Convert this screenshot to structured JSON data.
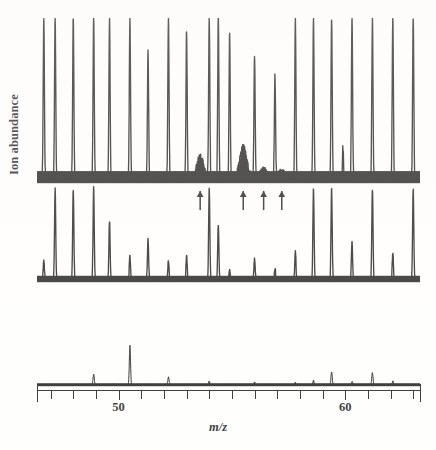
{
  "figure": {
    "type": "mass-spectrum",
    "ylabel": "Ion abundance",
    "xlabel": "m/z"
  },
  "axis": {
    "tick_labels": [
      {
        "value": 50,
        "text": "50"
      },
      {
        "value": 60,
        "text": "60"
      }
    ],
    "xlim": [
      46.4,
      63.3
    ],
    "tick_step": 1,
    "labelled_ticks": [
      50,
      60
    ]
  },
  "annotations": {
    "arrow_glyph": "arrow-up",
    "arrow_positions_mz": [
      53.6,
      55.5,
      56.4,
      57.2
    ]
  },
  "chart_data": {
    "type": "line",
    "title": "",
    "subtitle": "",
    "xlabel": "m/z",
    "ylabel": "Ion abundance",
    "xlim": [
      46.4,
      63.3
    ],
    "grid": false,
    "legend": null,
    "panels": [
      {
        "name": "top-trace",
        "baseline_noise": 0.035,
        "clipped": true,
        "peaks": [
          {
            "mz": 46.7,
            "height": 1.0,
            "clipped": true
          },
          {
            "mz": 47.2,
            "height": 1.0,
            "clipped": true
          },
          {
            "mz": 48.0,
            "height": 1.0,
            "clipped": true
          },
          {
            "mz": 48.9,
            "height": 1.0,
            "clipped": true
          },
          {
            "mz": 49.6,
            "height": 1.0,
            "clipped": true
          },
          {
            "mz": 50.5,
            "height": 1.0,
            "clipped": true
          },
          {
            "mz": 51.3,
            "height": 0.78,
            "clipped": false
          },
          {
            "mz": 52.2,
            "height": 1.0,
            "clipped": true
          },
          {
            "mz": 53.0,
            "height": 0.93,
            "clipped": false
          },
          {
            "mz": 53.6,
            "height": 0.14,
            "clipped": false,
            "broad": true
          },
          {
            "mz": 54.0,
            "height": 1.0,
            "clipped": true
          },
          {
            "mz": 54.4,
            "height": 1.0,
            "clipped": true
          },
          {
            "mz": 54.9,
            "height": 0.9,
            "clipped": false
          },
          {
            "mz": 55.5,
            "height": 0.2,
            "clipped": false,
            "broad": true
          },
          {
            "mz": 56.0,
            "height": 0.76,
            "clipped": false
          },
          {
            "mz": 56.4,
            "height": 0.06,
            "clipped": false,
            "broad": true
          },
          {
            "mz": 56.9,
            "height": 0.64,
            "clipped": false
          },
          {
            "mz": 57.2,
            "height": 0.05,
            "clipped": false,
            "broad": true
          },
          {
            "mz": 57.8,
            "height": 1.0,
            "clipped": true
          },
          {
            "mz": 58.6,
            "height": 1.0,
            "clipped": true
          },
          {
            "mz": 59.4,
            "height": 1.0,
            "clipped": true
          },
          {
            "mz": 59.9,
            "height": 0.2,
            "clipped": false
          },
          {
            "mz": 60.3,
            "height": 1.0,
            "clipped": true
          },
          {
            "mz": 61.2,
            "height": 1.0,
            "clipped": true
          },
          {
            "mz": 62.1,
            "height": 1.0,
            "clipped": true
          },
          {
            "mz": 63.0,
            "height": 1.0,
            "clipped": true
          }
        ]
      },
      {
        "name": "middle-trace",
        "baseline_noise": 0.03,
        "clipped": true,
        "peaks": [
          {
            "mz": 46.7,
            "height": 0.22,
            "clipped": false
          },
          {
            "mz": 47.2,
            "height": 1.0,
            "clipped": true
          },
          {
            "mz": 48.0,
            "height": 1.0,
            "clipped": true
          },
          {
            "mz": 48.9,
            "height": 1.0,
            "clipped": true
          },
          {
            "mz": 49.6,
            "height": 0.66,
            "clipped": false
          },
          {
            "mz": 50.5,
            "height": 0.27,
            "clipped": false
          },
          {
            "mz": 51.3,
            "height": 0.44,
            "clipped": false
          },
          {
            "mz": 52.2,
            "height": 0.21,
            "clipped": false
          },
          {
            "mz": 53.0,
            "height": 0.27,
            "clipped": false
          },
          {
            "mz": 54.0,
            "height": 1.0,
            "clipped": true
          },
          {
            "mz": 54.4,
            "height": 0.6,
            "clipped": false
          },
          {
            "mz": 54.9,
            "height": 0.12,
            "clipped": false
          },
          {
            "mz": 56.0,
            "height": 0.23,
            "clipped": false
          },
          {
            "mz": 56.9,
            "height": 0.13,
            "clipped": false
          },
          {
            "mz": 57.8,
            "height": 0.33,
            "clipped": false
          },
          {
            "mz": 58.6,
            "height": 1.0,
            "clipped": true
          },
          {
            "mz": 59.4,
            "height": 1.0,
            "clipped": true
          },
          {
            "mz": 60.3,
            "height": 0.42,
            "clipped": false
          },
          {
            "mz": 61.2,
            "height": 1.0,
            "clipped": true
          },
          {
            "mz": 62.1,
            "height": 0.3,
            "clipped": false
          },
          {
            "mz": 63.0,
            "height": 1.0,
            "clipped": true
          }
        ]
      },
      {
        "name": "bottom-trace",
        "baseline_noise": 0.012,
        "clipped": false,
        "peaks": [
          {
            "mz": 48.9,
            "height": 0.14,
            "clipped": false
          },
          {
            "mz": 50.5,
            "height": 0.5,
            "clipped": false
          },
          {
            "mz": 52.2,
            "height": 0.1,
            "clipped": false
          },
          {
            "mz": 54.0,
            "height": 0.04,
            "clipped": false
          },
          {
            "mz": 56.0,
            "height": 0.03,
            "clipped": false
          },
          {
            "mz": 57.8,
            "height": 0.03,
            "clipped": false
          },
          {
            "mz": 58.6,
            "height": 0.05,
            "clipped": false
          },
          {
            "mz": 59.4,
            "height": 0.17,
            "clipped": false
          },
          {
            "mz": 60.3,
            "height": 0.04,
            "clipped": false
          },
          {
            "mz": 61.2,
            "height": 0.16,
            "clipped": false
          },
          {
            "mz": 62.1,
            "height": 0.05,
            "clipped": false
          }
        ]
      }
    ]
  }
}
